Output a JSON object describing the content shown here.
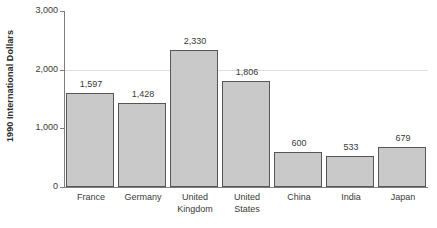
{
  "chart_data": {
    "type": "bar",
    "title": "",
    "subtitle": "",
    "xlabel": "",
    "ylabel": "1990 International Dollars",
    "ylim": [
      0,
      3000
    ],
    "ytick_values": [
      0,
      1000,
      2000,
      3000
    ],
    "ytick_labels": [
      "0",
      "1,000",
      "2,000",
      "3,000"
    ],
    "grid": "horizontal-gridline-at-2000-only",
    "legend": "none",
    "categories": [
      "France",
      "United Kingdom",
      "United States",
      "China",
      "India",
      "Japan",
      "Germany"
    ],
    "bars": [
      {
        "category": "France",
        "label_lines": [
          "France"
        ],
        "value": 1597,
        "value_label": "1,597"
      },
      {
        "category": "Germany",
        "label_lines": [
          "Germany"
        ],
        "value": 1428,
        "value_label": "1,428"
      },
      {
        "category": "United Kingdom",
        "label_lines": [
          "United",
          "Kingdom"
        ],
        "value": 2330,
        "value_label": "2,330"
      },
      {
        "category": "United States",
        "label_lines": [
          "United",
          "States"
        ],
        "value": 1806,
        "value_label": "1,806"
      },
      {
        "category": "China",
        "label_lines": [
          "China"
        ],
        "value": 600,
        "value_label": "600"
      },
      {
        "category": "India",
        "label_lines": [
          "India"
        ],
        "value": 533,
        "value_label": "533"
      },
      {
        "category": "Japan",
        "label_lines": [
          "Japan"
        ],
        "value": 679,
        "value_label": "679"
      }
    ],
    "values": [
      1597,
      1428,
      2330,
      1806,
      600,
      533,
      679
    ],
    "colors": {
      "bar_fill": "#c9c9c9",
      "bar_border": "#565656",
      "axis": "#7d7d7d",
      "gridline": "#dedede",
      "text": "#3a3a3a",
      "background": "#ffffff"
    }
  }
}
